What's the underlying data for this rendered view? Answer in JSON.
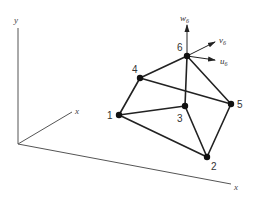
{
  "diagram": {
    "type": "3D tetrahedral finite element with nodes and nodal displacement components",
    "axes": {
      "vertical": {
        "label": "y"
      },
      "diagonal": {
        "label": "x"
      },
      "horizontal": {
        "label": "x"
      }
    },
    "nodes": [
      {
        "id": "1",
        "label": "1",
        "x": 119,
        "y": 115
      },
      {
        "id": "2",
        "label": "2",
        "x": 207,
        "y": 157
      },
      {
        "id": "3",
        "label": "3",
        "x": 185,
        "y": 106
      },
      {
        "id": "4",
        "label": "4",
        "x": 140,
        "y": 78
      },
      {
        "id": "5",
        "label": "5",
        "x": 231,
        "y": 104
      },
      {
        "id": "6",
        "label": "6",
        "x": 187,
        "y": 56
      }
    ],
    "edges": [
      [
        "1",
        "4"
      ],
      [
        "1",
        "3"
      ],
      [
        "1",
        "2"
      ],
      [
        "4",
        "6"
      ],
      [
        "4",
        "5"
      ],
      [
        "6",
        "3"
      ],
      [
        "6",
        "5"
      ],
      [
        "3",
        "2"
      ],
      [
        "5",
        "2"
      ]
    ],
    "displacement_vectors": {
      "node": "6",
      "w": {
        "base": "w",
        "sub": "6"
      },
      "v": {
        "base": "v",
        "sub": "6"
      },
      "u": {
        "base": "u",
        "sub": "6"
      }
    },
    "colors": {
      "line": "#222222",
      "axis": "#555555",
      "node": "#111111"
    }
  }
}
